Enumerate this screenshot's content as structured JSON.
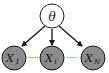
{
  "diagram": {
    "type": "graphical-model",
    "colors": {
      "background": "#ffffff",
      "observed_fill": "#8c8c8c",
      "latent_fill": "#ffffff",
      "stroke": "#1a1a1a",
      "text": "#111111"
    },
    "parent": {
      "id": "theta",
      "label": "θ",
      "kind": "latent"
    },
    "children": [
      {
        "id": "x1",
        "label": "X",
        "subscript": "1",
        "kind": "observed"
      },
      {
        "id": "xi",
        "label": "X",
        "subscript": "i",
        "kind": "observed"
      },
      {
        "id": "xN",
        "label": "X",
        "subscript": "N",
        "kind": "observed"
      }
    ],
    "ellipsis": "·····",
    "edges": [
      {
        "from": "theta",
        "to": "x1"
      },
      {
        "from": "theta",
        "to": "xi"
      },
      {
        "from": "theta",
        "to": "xN"
      }
    ]
  }
}
